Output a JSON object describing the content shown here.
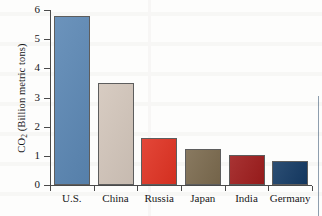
{
  "chart_data": {
    "type": "bar",
    "title": "",
    "xlabel": "",
    "ylabel": "CO2 (Billion metric tons)",
    "ylabel_prefix": "CO",
    "ylabel_subscript": "2",
    "ylabel_suffix": " (Billion metric tons)",
    "categories": [
      "U.S.",
      "China",
      "Russia",
      "Japan",
      "India",
      "Germany"
    ],
    "values": [
      5.8,
      3.5,
      1.62,
      1.22,
      1.04,
      0.84
    ],
    "colors": [
      "#5b87b4",
      "#d3c6bb",
      "#e03222",
      "#7b6a4e",
      "#9e1c1c",
      "#143a64"
    ],
    "ylim": [
      0,
      6
    ],
    "yticks": [
      0,
      1,
      2,
      3,
      4,
      5,
      6
    ],
    "ytick_labels": [
      "0",
      "1",
      "2",
      "3",
      "4",
      "5",
      "6"
    ],
    "grid": false,
    "legend": false
  },
  "axis": {
    "line_color": "#4a4a4a"
  }
}
